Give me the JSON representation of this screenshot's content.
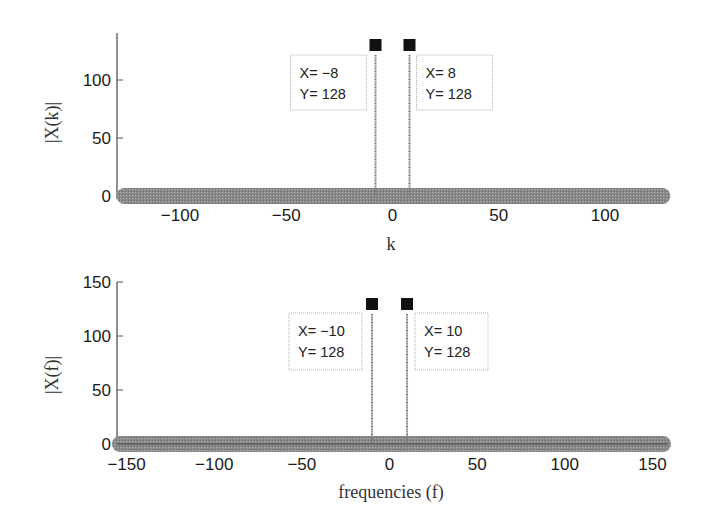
{
  "chart_data": [
    {
      "type": "stem",
      "title": "",
      "xlabel": "k",
      "ylabel": "|X(k)|",
      "xlim": [
        -128,
        127
      ],
      "ylim": [
        0,
        140
      ],
      "xticks": [
        -100,
        -50,
        0,
        50,
        100
      ],
      "xtick_labels": [
        "−100",
        "−50",
        "0",
        "50",
        "100"
      ],
      "yticks": [
        0,
        50,
        100
      ],
      "ytick_labels": [
        "0",
        "50",
        "100"
      ],
      "grid": false,
      "baseline_value": 0,
      "baseline_range": [
        -128,
        127
      ],
      "peaks": [
        {
          "x": -8,
          "y": 128
        },
        {
          "x": 8,
          "y": 128
        }
      ],
      "datatips": [
        {
          "x_label": "X= −8",
          "y_label": "Y= 128",
          "anchor_x": -8,
          "side": "left"
        },
        {
          "x_label": "X= 8",
          "y_label": "Y= 128",
          "anchor_x": 8,
          "side": "right"
        }
      ]
    },
    {
      "type": "stem",
      "title": "",
      "xlabel": "frequencies (f)",
      "ylabel": "|X(f)|",
      "xlim": [
        -156,
        160
      ],
      "ylim": [
        0,
        150
      ],
      "xticks": [
        -150,
        -100,
        -50,
        0,
        50,
        100,
        150
      ],
      "xtick_labels": [
        "−150",
        "−100",
        "−50",
        "0",
        "50",
        "100",
        "150"
      ],
      "yticks": [
        0,
        50,
        100,
        150
      ],
      "ytick_labels": [
        "0",
        "50",
        "100",
        "150"
      ],
      "grid": false,
      "baseline_value": 0,
      "baseline_range": [
        -160,
        160
      ],
      "peaks": [
        {
          "x": -10,
          "y": 128
        },
        {
          "x": 10,
          "y": 128
        }
      ],
      "datatips": [
        {
          "x_label": "X= −10",
          "y_label": "Y= 128",
          "anchor_x": -10,
          "side": "left"
        },
        {
          "x_label": "X= 10",
          "y_label": "Y= 128",
          "anchor_x": 10,
          "side": "right"
        }
      ]
    }
  ],
  "colors": {
    "axis": "#555555",
    "stem": "#777777",
    "baseline_band": "#8a8a8a",
    "marker": "#111111",
    "tip_border": "#b5b5b5"
  }
}
